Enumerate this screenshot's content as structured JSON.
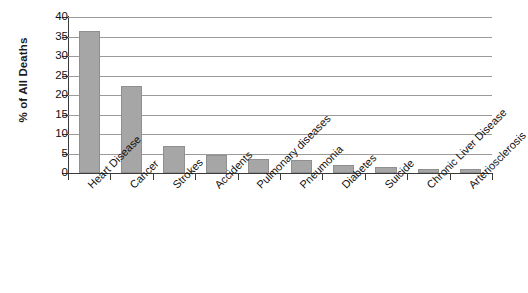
{
  "chart_data": {
    "type": "bar",
    "title": "",
    "subtitle": "",
    "xlabel": "",
    "ylabel": "% of All Deaths",
    "ylim": [
      0,
      40
    ],
    "ytick_step": 5,
    "yticks": [
      "40",
      "35",
      "30",
      "25",
      "20",
      "15",
      "10",
      "5",
      "0"
    ],
    "grid": "horizontal",
    "legend": "none",
    "bar_color": "#a6a6a6",
    "bar_border_color": "#8f8f8f",
    "axis_color": "#3a3a3a",
    "gridline_color": "#9b9b9b",
    "background_color": "#ffffff",
    "xtick_label_rotation": -45,
    "categories": [
      "Heart Disease",
      "Cancer",
      "Strokes",
      "Accidents",
      "Pulmonary diseases",
      "Pneumonia",
      "Diabetes",
      "Suicide",
      "Chronic Liver Disease",
      "Arteriosclerosis"
    ],
    "values": [
      36.3,
      22.2,
      7.0,
      4.5,
      3.6,
      3.4,
      2.0,
      1.6,
      1.1,
      1.0
    ]
  }
}
